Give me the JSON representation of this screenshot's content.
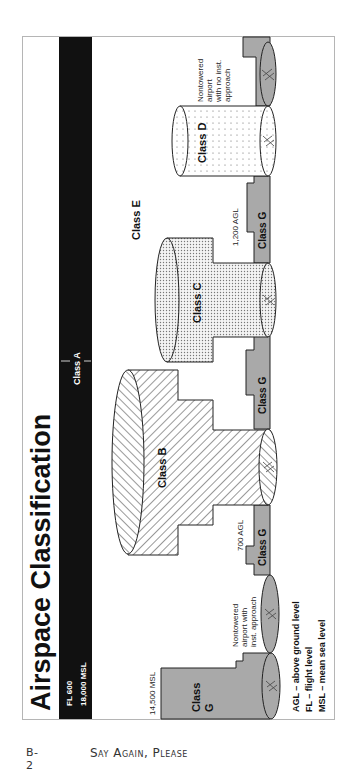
{
  "figure": {
    "title": "Airspace Classification",
    "class_a_bar": {
      "label": "Class A",
      "lower_limit": "18,000 MSL",
      "upper_limit": "FL 600"
    },
    "labels": {
      "class_b": "Class B",
      "class_c": "Class C",
      "class_d": "Class D",
      "class_e": "Class E",
      "class_g": "Class G",
      "class_g_large_line1": "Class",
      "class_g_large_line2": "G"
    },
    "altitudes": {
      "agl_1200": "1,200 AGL",
      "agl_700": "700 AGL",
      "msl_14500": "14,500 MSL"
    },
    "airport_notes": {
      "no_inst": [
        "Nontowered",
        "airport",
        "with no inst.",
        "approach"
      ],
      "with_inst": [
        "Nontowered",
        "airport with",
        "inst. approach"
      ]
    },
    "legend": [
      "AGL – above ground level",
      "FL – flight level",
      "MSL – mean sea level"
    ],
    "colors": {
      "class_a_bar": "#111111",
      "class_g_fill": "#a9a9a9",
      "outline": "#222222",
      "frame": "#b5b5b5"
    }
  },
  "footer": {
    "page": "B-2",
    "book_title": "Say Again, Please"
  }
}
